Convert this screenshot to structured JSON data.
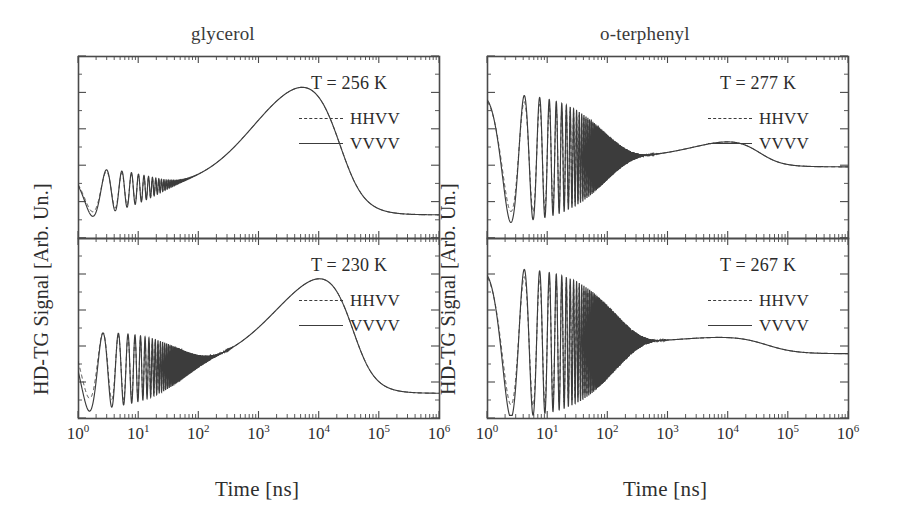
{
  "figure": {
    "background": "#ffffff",
    "line_color": "#3c3c3c",
    "axis_color": "#4a4a4a"
  },
  "columns": [
    {
      "id": "glycerol",
      "title": "glycerol"
    },
    {
      "id": "o-terphenyl",
      "title": "o-terphenyl"
    }
  ],
  "axes": {
    "xlabel": "Time [ns]",
    "ylabel": "HD-TG Signal [Arb. Un.]",
    "x_tick_labels": [
      "10",
      "10",
      "10",
      "10",
      "10",
      "10",
      "10"
    ],
    "x_tick_exponents": [
      "0",
      "1",
      "2",
      "3",
      "4",
      "5",
      "6"
    ],
    "x_scale": "log",
    "x_range_decades": [
      0,
      6
    ],
    "y_scale": "linear",
    "y_ticks_visible": true,
    "y_tick_labels_visible": false
  },
  "legend": {
    "entries": [
      {
        "label": "HHVV",
        "style": "dashed"
      },
      {
        "label": "VVVV",
        "style": "solid"
      }
    ]
  },
  "panels": [
    {
      "id": "glycerol-256",
      "column": "glycerol",
      "row": "top",
      "temperature_label": "T = 256 K",
      "temperature_value": 256,
      "temperature_units": "K",
      "sample": "glycerol"
    },
    {
      "id": "glycerol-230",
      "column": "glycerol",
      "row": "bottom",
      "temperature_label": "T = 230 K",
      "temperature_value": 230,
      "temperature_units": "K",
      "sample": "glycerol"
    },
    {
      "id": "otp-277",
      "column": "o-terphenyl",
      "row": "top",
      "temperature_label": "T = 277 K",
      "temperature_value": 277,
      "temperature_units": "K",
      "sample": "o-terphenyl"
    },
    {
      "id": "otp-267",
      "column": "o-terphenyl",
      "row": "bottom",
      "temperature_label": "T = 267 K",
      "temperature_value": 267,
      "temperature_units": "K",
      "sample": "o-terphenyl"
    }
  ],
  "chart_data": {
    "type": "line",
    "xlabel": "Time [ns]",
    "ylabel": "HD-TG Signal [Arb. Un.]",
    "xscale": "log",
    "xlim": [
      1,
      1000000
    ],
    "ylim": [
      0,
      1
    ],
    "grid": false,
    "legend_position": "upper-right inside panel",
    "panels": [
      {
        "id": "glycerol-256",
        "annotation": "T = 256 K",
        "series": [
          {
            "name": "VVVV",
            "style": "solid"
          },
          {
            "name": "HHVV",
            "style": "dashed"
          }
        ],
        "model": {
          "acoustic": {
            "frequency_ghz": 0.42,
            "damping_ns": 18,
            "amplitude": 0.14,
            "chirp": 1.0
          },
          "thermal_rise": {
            "center_log10_ns": 2.95,
            "width_decades": 1.15,
            "amplitude": 0.74
          },
          "thermal_decay": {
            "center_log10_ns": 4.45,
            "width_decades": 0.55
          },
          "baseline": 0.26,
          "floor": 0.07,
          "hhvv_offset_start": 0.02
        },
        "described_features": [
          "Damped acoustic oscillations from ~0.3 ns to ~100 ns riding on a rising background",
          "Broad thermal peak maximum near 1000 ns",
          "Sigmoidal decay to a flat baseline after 1e5 ns"
        ]
      },
      {
        "id": "glycerol-230",
        "annotation": "T = 230 K",
        "series": [
          {
            "name": "VVVV",
            "style": "solid"
          },
          {
            "name": "HHVV",
            "style": "dashed"
          }
        ],
        "model": {
          "acoustic": {
            "frequency_ghz": 0.48,
            "damping_ns": 55,
            "amplitude": 0.22,
            "chirp": 1.0
          },
          "thermal_rise": {
            "center_log10_ns": 3.35,
            "width_decades": 1.2,
            "amplitude": 0.7
          },
          "thermal_decay": {
            "center_log10_ns": 4.65,
            "width_decades": 0.5
          },
          "baseline": 0.27,
          "floor": 0.08,
          "hhvv_offset_start": 0.09
        },
        "described_features": [
          "Stronger, longer-lived acoustic oscillations reaching ~100 ns",
          "HHVV trace lies above VVVV at early times (structural relaxation)",
          "Thermal peak maximum shifted to ~4000 ns"
        ]
      },
      {
        "id": "otp-277",
        "annotation": "T = 277 K",
        "series": [
          {
            "name": "VVVV",
            "style": "solid"
          },
          {
            "name": "HHVV",
            "style": "dashed"
          }
        ],
        "model": {
          "acoustic": {
            "frequency_ghz": 0.3,
            "damping_ns": 95,
            "amplitude": 0.36,
            "chirp": 1.0
          },
          "thermal_rise": {
            "center_log10_ns": 3.5,
            "width_decades": 1.0,
            "amplitude": 0.13
          },
          "thermal_decay": {
            "center_log10_ns": 4.6,
            "width_decades": 0.5
          },
          "baseline": 0.44,
          "floor": 0.37,
          "hhvv_offset_start": 0.05
        },
        "described_features": [
          "Large-amplitude acoustic oscillations persisting out to ~300 ns",
          "Shallow thermal bump peaking near 5000 ns",
          "Small step down to a flat plateau past 1e5 ns"
        ]
      },
      {
        "id": "otp-267",
        "annotation": "T = 267 K",
        "series": [
          {
            "name": "VVVV",
            "style": "solid"
          },
          {
            "name": "HHVV",
            "style": "dashed"
          }
        ],
        "model": {
          "acoustic": {
            "frequency_ghz": 0.3,
            "damping_ns": 140,
            "amplitude": 0.42,
            "chirp": 1.0
          },
          "thermal_rise": {
            "center_log10_ns": 3.3,
            "width_decades": 1.0,
            "amplitude": 0.04
          },
          "thermal_decay": {
            "center_log10_ns": 4.7,
            "width_decades": 0.6
          },
          "baseline": 0.42,
          "floor": 0.33,
          "hhvv_offset_start": 0.06
        },
        "described_features": [
          "Very long-lived acoustic oscillations out to ~500 ns",
          "Nearly flat plateau from 1e3 to 1e4 ns",
          "Gentle decay to the final baseline after 1e5 ns"
        ]
      }
    ]
  },
  "geometry": {
    "panels": [
      {
        "id": "glycerol-256",
        "x": 78,
        "y": 56,
        "w": 361,
        "h": 182
      },
      {
        "id": "glycerol-230",
        "x": 78,
        "y": 238,
        "w": 361,
        "h": 180
      },
      {
        "id": "otp-277",
        "x": 487,
        "y": 56,
        "w": 361,
        "h": 182
      },
      {
        "id": "otp-267",
        "x": 487,
        "y": 238,
        "w": 361,
        "h": 180
      }
    ]
  }
}
